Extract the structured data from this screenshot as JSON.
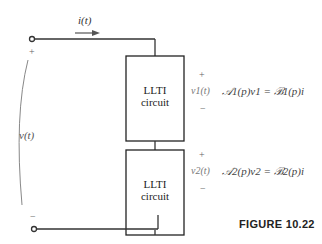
{
  "diagram": {
    "current_label": "i(t)",
    "voltage_label": "v(t)",
    "voltage_plus": "+",
    "voltage_minus": "−",
    "blocks": [
      {
        "line1": "LLTI",
        "line2": "circuit",
        "plus": "+",
        "minus": "−",
        "voltage_label": "v1(t)",
        "equation": "𝒜1(p)v1 = ℬ1(p)i"
      },
      {
        "line1": "LLTI",
        "line2": "circuit",
        "plus": "+",
        "minus": "−",
        "voltage_label": "v2(t)",
        "equation": "𝒜2(p)v2 = ℬ2(p)i"
      }
    ],
    "caption": "FIGURE 10.22"
  }
}
